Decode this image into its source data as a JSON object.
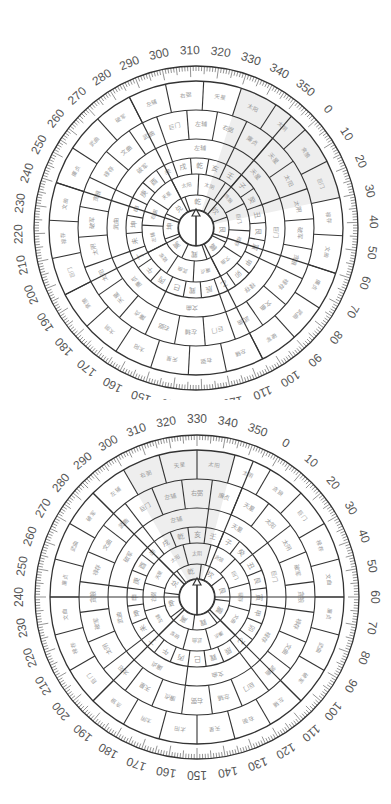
{
  "colors": {
    "line": "#333333",
    "text": "#9a9a9a",
    "label": "#555555",
    "highlight": "#eeeeee",
    "background": "#ffffff"
  },
  "degree_labels": [
    "0",
    "10",
    "20",
    "30",
    "40",
    "50",
    "60",
    "70",
    "80",
    "90",
    "100",
    "110",
    "120",
    "130",
    "140",
    "150",
    "160",
    "170",
    "180",
    "190",
    "200",
    "210",
    "220",
    "230",
    "240",
    "250",
    "260",
    "270",
    "280",
    "290",
    "300",
    "310",
    "320",
    "330",
    "340",
    "350"
  ],
  "trigrams": [
    "坎",
    "艮",
    "震",
    "巽",
    "离",
    "坤",
    "兑",
    "乾"
  ],
  "mountains": [
    "子",
    "癸",
    "丑",
    "艮",
    "寅",
    "甲",
    "卯",
    "乙",
    "辰",
    "巽",
    "巳",
    "丙",
    "午",
    "丁",
    "未",
    "坤",
    "申",
    "庚",
    "酉",
    "辛",
    "戌",
    "乾",
    "亥",
    "壬"
  ],
  "stars": [
    "贪狼",
    "巨门",
    "禄存",
    "文曲",
    "廉贞",
    "武曲",
    "破军",
    "左辅",
    "右弼",
    "天星",
    "太阳",
    "太阴"
  ],
  "ring4_words": [
    "天星",
    "巨门",
    "禄存",
    "文曲",
    "廉贞",
    "武曲",
    "破军",
    "左辅"
  ],
  "ring5_words": [
    "天星",
    "太阳",
    "太阴",
    "破军",
    "贪狼",
    "禄存",
    "文曲",
    "武曲",
    "巨门",
    "左辅",
    "右弼",
    "廉贞"
  ],
  "dials": [
    {
      "id": "top",
      "center": [
        196,
        228
      ],
      "rotation_offset_deg": 48,
      "highlight_sector": [
        330,
        30
      ],
      "needle": "north-arrow"
    },
    {
      "id": "bottom",
      "center": [
        197,
        597
      ],
      "rotation_offset_deg": 30,
      "highlight_sector": [
        300,
        345
      ],
      "needle": "north-arrow"
    }
  ],
  "geometry": {
    "radii": [
      18,
      33,
      54,
      70,
      89,
      118,
      147,
      162
    ],
    "label_radius": 177
  }
}
